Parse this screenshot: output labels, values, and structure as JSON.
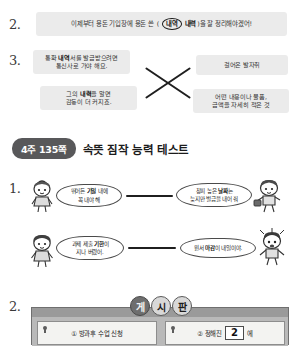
{
  "worksheet": {
    "q2": {
      "number": "2.",
      "prefix": "이제부터 용돈 기입장에 용돈 쓴",
      "choice_circled": "내역",
      "choice_other": "내력",
      "suffix": ")을 잘 정리해야겠어!",
      "open_paren": "("
    },
    "q3": {
      "number": "3.",
      "left_items": [
        {
          "line1_pre": "통화 ",
          "line1_bold": "내역",
          "line1_post": "서를 발급받으려면",
          "line2": "통신사로 가야 해요."
        },
        {
          "line1_pre": "그의 ",
          "line1_bold": "내력",
          "line1_post": "을 알면",
          "line2": "감동이 더 커지죠."
        }
      ],
      "right_items": [
        {
          "line1": "걸어온 발자취",
          "line2": ""
        },
        {
          "line1": "어떤 내용이나 물품,",
          "line2": "금액을 자세히 적은 것"
        }
      ]
    },
    "section": {
      "badge": "4주 135쪽",
      "title": "속뜻 짐작 능력 테스트"
    },
    "q1": {
      "number": "1.",
      "pairs": [
        {
          "left_l1_pre": "뛰어든 ",
          "left_l1_bold": "기일",
          "left_l1_post": " 내에",
          "left_l2": "꼭 내야 해",
          "right_l1_pre": "창피 높은 ",
          "right_l1_bold": "날짜",
          "right_l1_post": "는",
          "right_l2": "늦지만 벌금을 내어 줘"
        },
        {
          "left_l1_pre": "과제 제출 ",
          "left_l1_bold": "기한",
          "left_l1_post": "이",
          "left_l2": "지나 버렸어.",
          "right_l1_pre": "원서 ",
          "right_l1_bold": "마감",
          "right_l1_post": "이 내일이야.",
          "right_l2": ""
        }
      ]
    },
    "q2b": {
      "number": "2.",
      "board_title_chars": [
        "게",
        "시",
        "판"
      ],
      "cards": [
        {
          "label": "① 방과후 수업 신청",
          "blank": ""
        },
        {
          "label_pre": "② 정해진",
          "blank": "2",
          "label_post": "에"
        }
      ]
    }
  },
  "colors": {
    "strip_bg": "#ebebeb",
    "badge_bg": "#58585a",
    "board_bg": "#9a9a9a",
    "ink": "#1f1f1f"
  }
}
